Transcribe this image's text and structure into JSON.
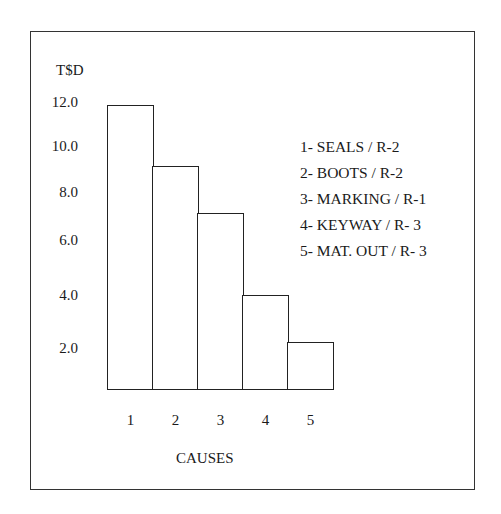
{
  "chart_data": {
    "type": "bar",
    "title": "",
    "ylabel": "T$D",
    "xlabel": "CAUSES",
    "categories": [
      "1",
      "2",
      "3",
      "4",
      "5"
    ],
    "values": [
      11.8,
      9.4,
      7.5,
      4.0,
      2.0
    ],
    "yticks": [
      "12.0",
      "10.0",
      "8.0",
      "6.0",
      "4.0",
      "2.0"
    ],
    "ylim": [
      0,
      12.5
    ],
    "grid": false,
    "legend_position": "upper right",
    "legend": [
      "1- SEALS /  R-2",
      "2- BOOTS / R-2",
      "3- MARKING / R-1",
      "4- KEYWAY / R- 3",
      "5- MAT. OUT / R- 3"
    ],
    "bar_style": {
      "fill": "#ffffff",
      "stroke": "#222222",
      "gap": 0
    }
  }
}
